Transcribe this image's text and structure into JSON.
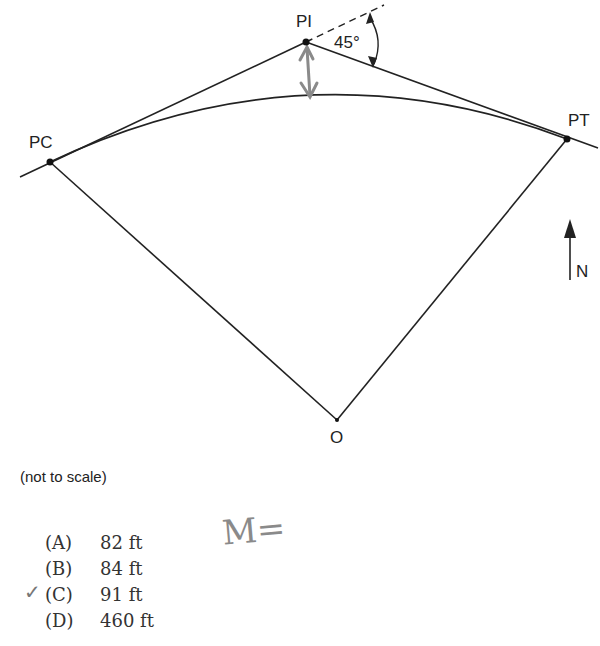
{
  "figure": {
    "points": {
      "pi": {
        "label": "PI",
        "x": 306,
        "y": 42
      },
      "pc": {
        "label": "PC",
        "x": 50,
        "y": 162
      },
      "pt": {
        "label": "PT",
        "x": 567,
        "y": 139
      },
      "o": {
        "label": "O",
        "x": 337,
        "y": 420
      }
    },
    "angle_label": "45°",
    "north_label": "N",
    "caption": "(not to scale)"
  },
  "choices": [
    {
      "letter": "(A)",
      "value": "82 ft"
    },
    {
      "letter": "(B)",
      "value": "84 ft"
    },
    {
      "letter": "(C)",
      "value": "91 ft"
    },
    {
      "letter": "(D)",
      "value": "460 ft"
    }
  ],
  "annotations": {
    "checkmark": "✓",
    "handwritten": "M="
  }
}
